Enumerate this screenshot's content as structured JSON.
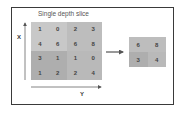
{
  "title": "Single depth slice",
  "axes": {
    "x_label": "X",
    "y_label": "Y"
  },
  "input_matrix": [
    [
      1,
      0,
      2,
      3
    ],
    [
      4,
      6,
      6,
      8
    ],
    [
      3,
      1,
      1,
      0
    ],
    [
      1,
      2,
      2,
      4
    ]
  ],
  "output_matrix": [
    [
      6,
      8
    ],
    [
      3,
      4
    ]
  ],
  "colors": {
    "quadrant_top_left": "#c8c8c8",
    "quadrant_top_right": "#bdbdbd",
    "quadrant_bottom_left": "#aeaeae",
    "quadrant_bottom_right": "#b9b9b9"
  }
}
